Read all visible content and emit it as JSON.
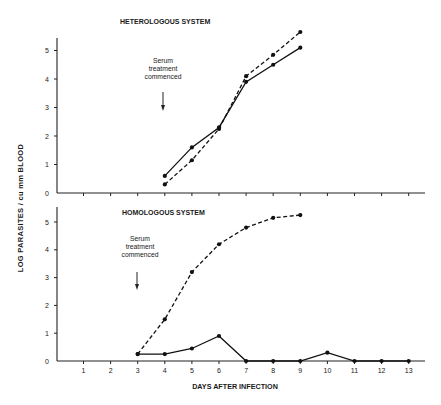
{
  "figure": {
    "ylabel": "LOG  PARASITES / cu  mm BLOOD",
    "xlabel": "DAYS AFTER  INFECTION"
  },
  "chart_data": [
    {
      "type": "line",
      "title": "HETEROLOGOUS SYSTEM",
      "xlabel": "DAYS AFTER INFECTION",
      "ylabel": "LOG PARASITES / cu mm BLOOD",
      "ylim": [
        0,
        5.5
      ],
      "yticks": [
        "0",
        "1",
        "2",
        "3",
        "4",
        "5"
      ],
      "xlim": [
        0,
        14
      ],
      "x_tick_count": 13,
      "annotation": {
        "lines": [
          "Serum",
          "treatment",
          "commenced"
        ],
        "arrow_at_day": 4
      },
      "series": [
        {
          "name": "solid",
          "style": "solid",
          "x": [
            4,
            5,
            6,
            7,
            8,
            9
          ],
          "values": [
            0.6,
            1.6,
            2.3,
            3.9,
            4.5,
            5.1
          ]
        },
        {
          "name": "dashed",
          "style": "dashed",
          "x": [
            4,
            5,
            6,
            7,
            8,
            9
          ],
          "values": [
            0.3,
            1.15,
            2.25,
            4.1,
            4.85,
            5.65
          ]
        }
      ]
    },
    {
      "type": "line",
      "title": "HOMOLOGOUS SYSTEM",
      "xlabel": "DAYS AFTER INFECTION",
      "ylabel": "LOG PARASITES / cu mm BLOOD",
      "ylim": [
        0,
        5.5
      ],
      "yticks": [
        "0",
        "1",
        "2",
        "3",
        "4",
        "5"
      ],
      "categories": [
        "1",
        "2",
        "3",
        "4",
        "5",
        "6",
        "7",
        "8",
        "9",
        "10",
        "11",
        "12",
        "13"
      ],
      "annotation": {
        "lines": [
          "Serum",
          "treatment",
          "commenced"
        ],
        "arrow_at_day": 3
      },
      "series": [
        {
          "name": "dashed",
          "style": "dashed",
          "x": [
            3,
            4,
            5,
            6,
            7,
            8,
            9
          ],
          "values": [
            0.25,
            1.5,
            3.2,
            4.2,
            4.8,
            5.15,
            5.25
          ]
        },
        {
          "name": "solid",
          "style": "solid",
          "x": [
            3,
            4,
            5,
            6,
            7,
            8,
            9,
            10,
            11,
            12,
            13
          ],
          "values": [
            0.25,
            0.25,
            0.45,
            0.9,
            0,
            0,
            0,
            0.3,
            0,
            0,
            0
          ]
        }
      ]
    }
  ]
}
